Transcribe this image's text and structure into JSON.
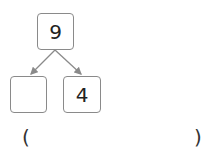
{
  "diagram": {
    "top_number": "9",
    "bottom_left": "",
    "bottom_right": "4",
    "answer_open": "(",
    "answer_close": ")",
    "answer_value": ""
  }
}
